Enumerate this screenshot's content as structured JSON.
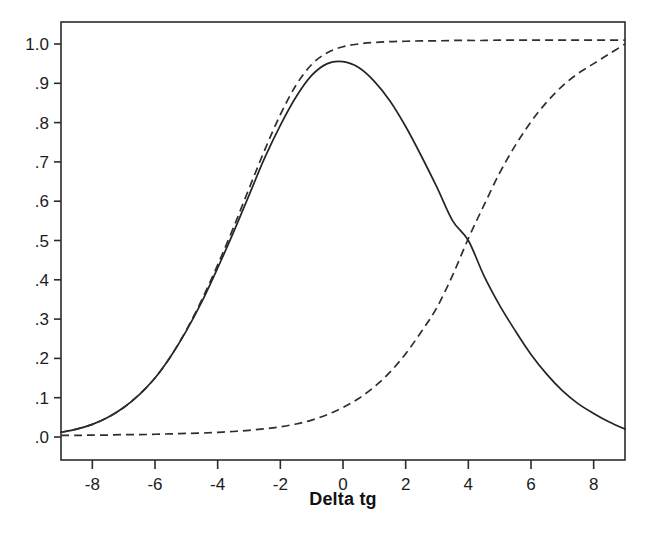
{
  "chart_data": {
    "type": "line",
    "title": "",
    "subtitle": "",
    "xlabel": "Delta tg",
    "ylabel": "",
    "xlim": [
      -9,
      9
    ],
    "ylim": [
      -0.04,
      1.06
    ],
    "grid": false,
    "legend_position": "none",
    "x_tick_labels": [
      "-8",
      "-6",
      "-4",
      "-2",
      "0",
      "2",
      "4",
      "6",
      "8"
    ],
    "x_tick_values": [
      -8,
      -6,
      -4,
      -2,
      0,
      2,
      4,
      6,
      8
    ],
    "y_tick_labels": [
      "1.0",
      ".9",
      ".8",
      ".7",
      ".6",
      ".5",
      ".4",
      ".3",
      ".2",
      ".1",
      ".0"
    ],
    "y_tick_values": [
      1.0,
      0.9,
      0.8,
      0.7,
      0.6,
      0.5,
      0.4,
      0.3,
      0.2,
      0.1,
      0.0
    ],
    "annotations": [],
    "x": [
      -9,
      -8.5,
      -8,
      -7.5,
      -7,
      -6.5,
      -6,
      -5.5,
      -5,
      -4.5,
      -4,
      -3.5,
      -3,
      -2.5,
      -2,
      -1.5,
      -1,
      -0.5,
      0,
      0.5,
      1,
      1.5,
      2,
      2.5,
      3,
      3.5,
      4,
      4.5,
      5,
      5.5,
      6,
      6.5,
      7,
      7.5,
      8,
      8.5,
      9
    ],
    "series": [
      {
        "name": "solid-bell-curve",
        "style": "solid",
        "values": [
          0.012,
          0.02,
          0.032,
          0.05,
          0.075,
          0.108,
          0.15,
          0.205,
          0.27,
          0.345,
          0.43,
          0.52,
          0.615,
          0.71,
          0.793,
          0.865,
          0.92,
          0.95,
          0.955,
          0.94,
          0.905,
          0.855,
          0.79,
          0.715,
          0.635,
          0.55,
          0.5,
          0.41,
          0.335,
          0.27,
          0.21,
          0.16,
          0.118,
          0.085,
          0.06,
          0.038,
          0.02
        ]
      },
      {
        "name": "dashed-upper-plateau-curve",
        "style": "dashed",
        "values": [
          0.012,
          0.02,
          0.032,
          0.05,
          0.075,
          0.108,
          0.15,
          0.205,
          0.272,
          0.35,
          0.438,
          0.532,
          0.632,
          0.73,
          0.82,
          0.895,
          0.948,
          0.978,
          0.993,
          1.0,
          1.004,
          1.006,
          1.007,
          1.008,
          1.008,
          1.009,
          1.009,
          1.009,
          1.01,
          1.01,
          1.01,
          1.01,
          1.01,
          1.01,
          1.01,
          1.01,
          1.01
        ]
      },
      {
        "name": "dashed-rising-sigmoid-curve",
        "style": "dashed",
        "values": [
          0.004,
          0.004,
          0.005,
          0.005,
          0.006,
          0.006,
          0.007,
          0.008,
          0.009,
          0.01,
          0.012,
          0.014,
          0.017,
          0.021,
          0.026,
          0.033,
          0.043,
          0.057,
          0.075,
          0.098,
          0.128,
          0.165,
          0.212,
          0.268,
          0.33,
          0.412,
          0.505,
          0.59,
          0.672,
          0.742,
          0.802,
          0.852,
          0.893,
          0.925,
          0.95,
          0.975,
          1.0
        ]
      }
    ]
  }
}
